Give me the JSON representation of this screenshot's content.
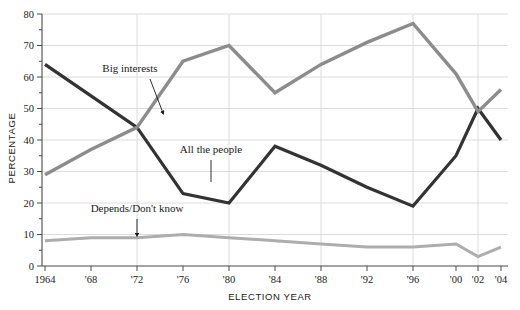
{
  "chart_data": {
    "type": "line",
    "title": "",
    "xlabel": "ELECTION YEAR",
    "ylabel": "PERCENTAGE",
    "ylim": [
      0,
      80
    ],
    "ytick_step": 10,
    "yminor_step": 5,
    "grid": "horizontal-and-vertical",
    "legend_position": "inline-annotations",
    "categories": [
      "1964",
      "'68",
      "'72",
      "'76",
      "'80",
      "'84",
      "'88",
      "'92",
      "'96",
      "'00",
      "'02",
      "'04"
    ],
    "tick_labels": [
      "1964",
      "'68",
      "'72",
      "'76",
      "'80",
      "'84",
      "'88",
      "'92",
      "'96",
      "'00",
      "'02",
      "'04"
    ],
    "ytick_labels": [
      "0",
      "10",
      "20",
      "30",
      "40",
      "50",
      "60",
      "70",
      "80"
    ],
    "series": [
      {
        "name": "All the people",
        "color": "#333333",
        "values": [
          64,
          54,
          44,
          23,
          20,
          38,
          32,
          25,
          19,
          35,
          50,
          40
        ]
      },
      {
        "name": "Big interests",
        "color": "#8c8c8c",
        "values": [
          29,
          37,
          44,
          65,
          70,
          55,
          64,
          71,
          77,
          61,
          49,
          56
        ]
      },
      {
        "name": "Depends/Don't know",
        "color": "#adadad",
        "values": [
          8,
          9,
          9,
          10,
          9,
          8,
          7,
          6,
          6,
          7,
          3,
          6
        ]
      }
    ],
    "annotations": [
      {
        "label": "Big interests",
        "series": "Big interests",
        "marker": "arrow"
      },
      {
        "label": "All the people",
        "series": "All the people",
        "marker": "line"
      },
      {
        "label": "Depends/Don't know",
        "series": "Depends/Don't know",
        "marker": "arrow"
      }
    ]
  }
}
